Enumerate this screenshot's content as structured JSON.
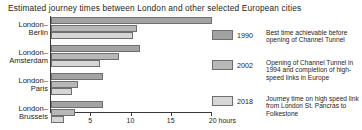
{
  "chart_data": {
    "type": "bar",
    "orientation": "horizontal",
    "title": "Estimated journey times between London and other selected European cities",
    "xlabel": "20 hours",
    "ylabel": "",
    "xlim": [
      0,
      20
    ],
    "grid": false,
    "legend_position": "right",
    "categories": [
      "London–Berlin",
      "London–Amsterdam",
      "London–Paris",
      "London–Brussels"
    ],
    "category_lines": [
      [
        "London–",
        "Berlin"
      ],
      [
        "London–",
        "Amsterdam"
      ],
      [
        "London–",
        "Paris"
      ],
      [
        "London–",
        "Brussels"
      ]
    ],
    "tick_values": [
      5,
      10,
      15,
      20
    ],
    "tick_labels": [
      "5",
      "10",
      "15",
      "20 hours"
    ],
    "series": [
      {
        "name": "1990",
        "color": "#a3a3a3",
        "description": "Best time achievable before opening of Channel Tunnel",
        "values": [
          20.0,
          11.0,
          6.5,
          6.5
        ]
      },
      {
        "name": "2002",
        "color": "#b8b8b8",
        "description": "Opening of Channel Tunnel in 1994 and completion of high-speed links in Europe",
        "values": [
          10.7,
          8.5,
          3.4,
          3.0
        ]
      },
      {
        "name": "2018",
        "color": "#d6d6d6",
        "description": "Journey time on high speed link from London St. Pancras to Folkestone",
        "values": [
          10.2,
          6.1,
          2.6,
          1.6
        ]
      }
    ]
  },
  "legend": [
    {
      "year": "1990",
      "description": "Best time achievable before opening of Channel Tunnel"
    },
    {
      "year": "2002",
      "description": "Opening of Channel Tunnel in 1994 and completion of high-speed links in Europe"
    },
    {
      "year": "2018",
      "description": "Journey time on high speed link from London St. Pancras to Folkestone"
    }
  ]
}
